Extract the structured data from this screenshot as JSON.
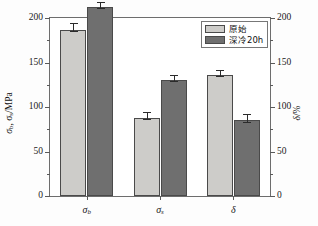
{
  "chart_data": {
    "type": "bar",
    "title": "",
    "subtitle": "",
    "categories": [
      "σb",
      "σs",
      "δ"
    ],
    "category_labels_html": [
      "σ<sub>b</sub>",
      "σ<sub>s</sub>",
      "δ"
    ],
    "series": [
      {
        "name": "原始",
        "color": "#cdccc9",
        "values": [
          187,
          88,
          136
        ],
        "errors": [
          7,
          6,
          6
        ]
      },
      {
        "name": "深冷20h",
        "color": "#6f6f6f",
        "values": [
          212,
          130,
          85
        ],
        "errors": [
          6,
          6,
          7
        ]
      }
    ],
    "xlabel": "",
    "ylabel_left": "σb, σs/MPa",
    "ylabel_right": "δ/%",
    "ylim": [
      0,
      200
    ],
    "ylim_right": [
      0,
      200
    ],
    "yticks": [
      0,
      50,
      100,
      150,
      200
    ],
    "yticks_right": [
      0,
      50,
      100,
      150,
      200
    ],
    "ytick_labels": [
      "0",
      "50",
      "100",
      "150",
      "200"
    ],
    "ytick_labels_right": [
      "0",
      "50",
      "100",
      "150",
      "200"
    ],
    "minor_tick_count": 1,
    "grid": false,
    "legend_position": "top-right",
    "frame": true
  },
  "legend": {
    "entries": [
      {
        "label": "原始"
      },
      {
        "label": "深冷20h"
      }
    ]
  },
  "axes": {
    "left_title_main": "σ",
    "left_title_sub1": "b",
    "left_title_mid": ", σ",
    "left_title_sub2": "s",
    "left_title_tail": "/MPa",
    "right_title_main": "δ",
    "right_title_tail": "/%"
  }
}
